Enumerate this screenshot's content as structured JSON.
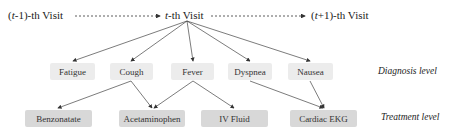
{
  "visits": {
    "prev": {
      "prefix": "(",
      "var": "t",
      "suffix": "-1)-th Visit"
    },
    "current": {
      "var": "t",
      "suffix": "-th Visit"
    },
    "next": {
      "prefix": "(",
      "var": "t",
      "suffix": "+1)-th Visit"
    }
  },
  "diagnosis": {
    "level_label": "Diagnosis level",
    "nodes": [
      "Fatigue",
      "Cough",
      "Fever",
      "Dyspnea",
      "Nausea"
    ]
  },
  "treatment": {
    "level_label": "Treatment level",
    "nodes": [
      "Benzonatate",
      "Acetaminophen",
      "IV Fluid",
      "Cardiac EKG"
    ]
  },
  "edges": {
    "visit_to_diagnosis": [
      "Fatigue",
      "Cough",
      "Fever",
      "Dyspnea",
      "Nausea"
    ],
    "diagnosis_to_treatment": [
      [
        "Cough",
        "Benzonatate"
      ],
      [
        "Cough",
        "Acetaminophen"
      ],
      [
        "Fever",
        "Acetaminophen"
      ],
      [
        "Fever",
        "IV Fluid"
      ],
      [
        "Dyspnea",
        "Cardiac EKG"
      ],
      [
        "Nausea",
        "Cardiac EKG"
      ]
    ]
  },
  "colors": {
    "diagnosis_box": "#ececec",
    "treatment_box": "#d8d8d8",
    "edge": "#444444"
  }
}
